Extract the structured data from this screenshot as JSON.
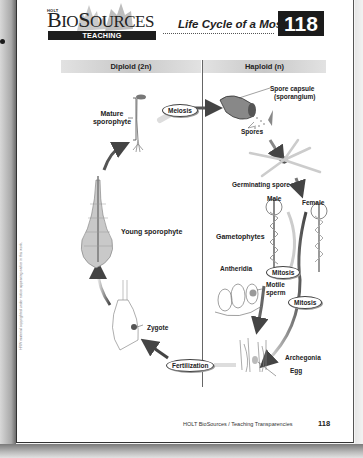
{
  "header": {
    "publisher": "HOLT",
    "brand": "BioSources",
    "brand_display_big_b": "B",
    "brand_display_io": "IO",
    "brand_display_s": "S",
    "brand_display_ources": "OURCES",
    "subtitle": "TEACHING TRANSPARENCIES",
    "title": "Life Cycle of a Moss",
    "number": "118"
  },
  "columns": {
    "diploid": "Diploid (2n)",
    "haploid": "Haploid (n)"
  },
  "labels": {
    "mature_sporophyte_1": "Mature",
    "mature_sporophyte_2": "sporophyte",
    "young_sporophyte": "Young sporophyte",
    "zygote": "Zygote",
    "spore_capsule_1": "Spore capsule",
    "spore_capsule_2": "(sporangium)",
    "spores": "Spores",
    "germinating_spore": "Germinating spore",
    "male": "Male",
    "female": "Female",
    "gametophytes": "Gametophytes",
    "antheridia": "Antheridia",
    "motile_sperm_1": "Motile",
    "motile_sperm_2": "sperm",
    "archegonia": "Archegonia",
    "egg": "Egg"
  },
  "processes": {
    "meiosis": "Meiosis",
    "mitosis_1": "Mitosis",
    "mitosis_2": "Mitosis",
    "fertilization": "Fertilization"
  },
  "footer": {
    "text": "HOLT BioSources / Teaching Transparencies",
    "page_number": "118"
  },
  "side_note": "HRW material copyrighted under notice appearing earlier in this work.",
  "colors": {
    "badge": "#1b1b1b",
    "arrow": "#555555",
    "header_band": "#c8c8c8"
  }
}
